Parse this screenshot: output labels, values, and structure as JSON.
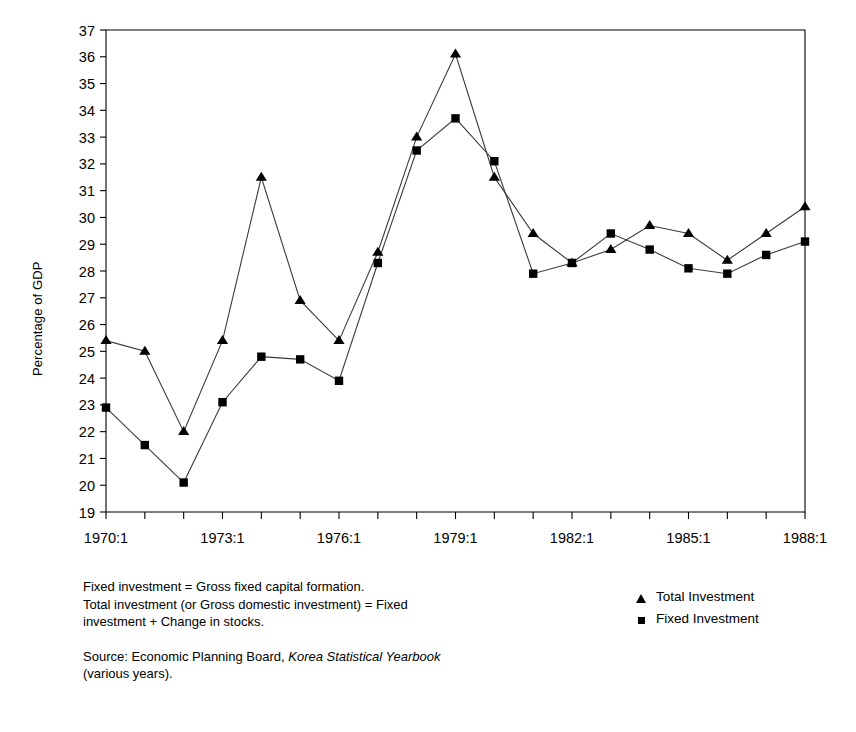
{
  "chart_data": {
    "type": "line",
    "title": "",
    "xlabel": "",
    "ylabel": "Percentage of GDP",
    "ylim": [
      19,
      37
    ],
    "yticks": [
      19,
      20,
      21,
      22,
      23,
      24,
      25,
      26,
      27,
      28,
      29,
      30,
      31,
      32,
      33,
      34,
      35,
      36,
      37
    ],
    "grid": false,
    "legend_position": "bottom-right",
    "x": [
      "1970:1",
      "1971:1",
      "1972:1",
      "1973:1",
      "1974:1",
      "1975:1",
      "1976:1",
      "1977:1",
      "1978:1",
      "1979:1",
      "1980:1",
      "1981:1",
      "1982:1",
      "1983:1",
      "1984:1",
      "1985:1",
      "1986:1",
      "1987:1",
      "1988:1"
    ],
    "xtick_labels": [
      "1970:1",
      "1973:1",
      "1976:1",
      "1979:1",
      "1982:1",
      "1985:1",
      "1988:1"
    ],
    "xtick_indices": [
      0,
      3,
      6,
      9,
      12,
      15,
      18
    ],
    "series": [
      {
        "name": "Total Investment",
        "marker": "triangle",
        "values": [
          25.4,
          25.0,
          22.0,
          25.4,
          31.5,
          26.9,
          25.4,
          28.7,
          33.0,
          36.1,
          31.5,
          29.4,
          28.3,
          28.8,
          29.7,
          29.4,
          28.4,
          29.4,
          30.4
        ]
      },
      {
        "name": "Fixed Investment",
        "marker": "square",
        "values": [
          22.9,
          21.5,
          20.1,
          23.1,
          24.8,
          24.7,
          23.9,
          28.3,
          32.5,
          33.7,
          32.1,
          27.9,
          28.3,
          29.4,
          28.8,
          28.1,
          27.9,
          28.6,
          29.1
        ]
      }
    ]
  },
  "legend": {
    "items": [
      {
        "label": "Total Investment",
        "marker": "triangle"
      },
      {
        "label": "Fixed Investment",
        "marker": "square"
      }
    ]
  },
  "notes": {
    "definition_line1": "Fixed investment = Gross fixed capital formation.",
    "definition_line2": "Total investment (or Gross domestic investment) = Fixed",
    "definition_line3": "investment + Change in stocks.",
    "source_prefix": "Source: Economic Planning Board, ",
    "source_italic": "Korea Statistical Yearbook",
    "source_suffix": "(various years)."
  },
  "colors": {
    "axis": "#000000",
    "line": "#3a3a3a",
    "marker": "#000000",
    "background": "#ffffff"
  }
}
